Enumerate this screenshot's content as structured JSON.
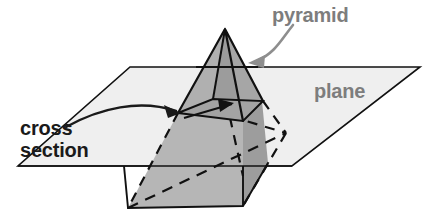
{
  "figure": {
    "labels": {
      "pyramid": "pyramid",
      "plane": "plane",
      "cross_line1": "cross",
      "cross_line2": "section"
    },
    "icons": {
      "pyramid_pointer": "curved-arrow-icon",
      "cross_section_pointer": "curved-arrow-icon"
    },
    "colors": {
      "background": "#ffffff",
      "plane_fill": "#efefef",
      "pyramid_light_face": "#adadad",
      "pyramid_dark_face": "#9a9a9a",
      "pyramid_lower_face": "#b4b4b4",
      "cross_section_fill": "#a0a0a0",
      "outline": "#111111",
      "label_gray": "#7d7d7d",
      "label_black": "#1a1a1a"
    },
    "geometry": {
      "plane_polygon": "130,67 420,67 292,166 18,166",
      "apex": "225,29",
      "cross_section_quad": "178,113 213,99 263,101 243,121",
      "base_front_left": "128,208",
      "base_front_right": "243,206",
      "base_back_right": "286,133",
      "base_back_left": "172,135"
    }
  }
}
